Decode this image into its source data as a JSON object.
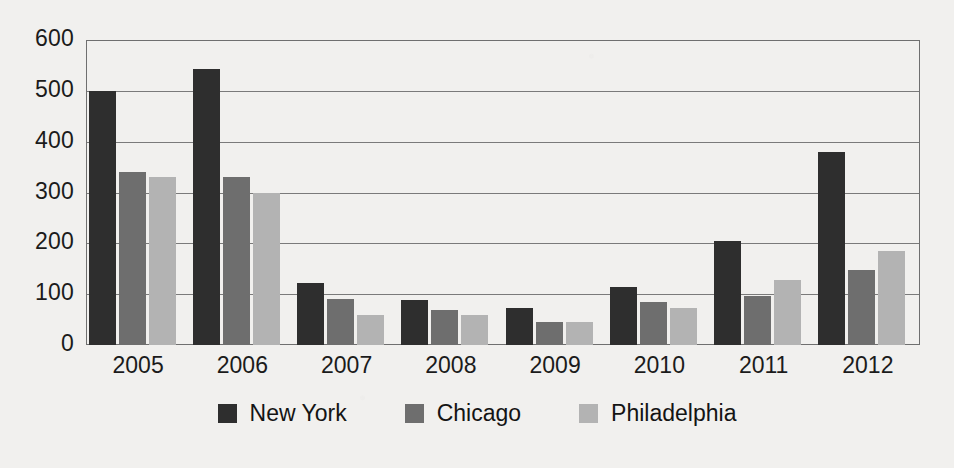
{
  "chart_data": {
    "type": "bar",
    "title": "",
    "subtitle": "",
    "xlabel": "",
    "ylabel": "",
    "categories": [
      "2005",
      "2006",
      "2007",
      "2008",
      "2009",
      "2010",
      "2011",
      "2012"
    ],
    "yticks": [
      "0",
      "100",
      "200",
      "300",
      "400",
      "500",
      "600"
    ],
    "ytick_values": [
      0,
      100,
      200,
      300,
      400,
      500,
      600
    ],
    "ylim": [
      0,
      600
    ],
    "grid": true,
    "legend_position": "bottom-center",
    "series": [
      {
        "name": "New York",
        "color": "#2e2e2e",
        "values": [
          500,
          542,
          122,
          88,
          73,
          115,
          205,
          380
        ]
      },
      {
        "name": "Chicago",
        "color": "#6e6e6e",
        "values": [
          340,
          330,
          90,
          68,
          45,
          85,
          97,
          148
        ]
      },
      {
        "name": "Philadelphia",
        "color": "#b3b3b3",
        "values": [
          330,
          300,
          60,
          60,
          45,
          72,
          127,
          185
        ]
      }
    ]
  },
  "legend": {
    "items": [
      {
        "label": "New York"
      },
      {
        "label": "Chicago"
      },
      {
        "label": "Philadelphia"
      }
    ]
  },
  "colors": {
    "background": "#f1f0ee",
    "axis": "#6f6f6f",
    "grid": "#7a7a7a",
    "text": "#1b1b1b",
    "series_new_york": "#2e2e2e",
    "series_chicago": "#6e6e6e",
    "series_philadelphia": "#b3b3b3"
  }
}
